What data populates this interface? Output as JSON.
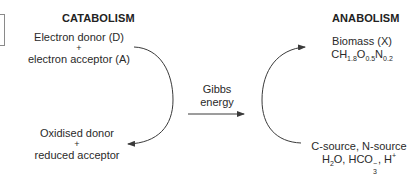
{
  "catabolism": {
    "heading": "CATABOLISM",
    "top_line1": "Electron donor (D)",
    "top_plus": "+",
    "top_line2": "electron acceptor (A)",
    "bottom_line1": "Oxidised donor",
    "bottom_plus": "+",
    "bottom_line2": "reduced acceptor"
  },
  "coupling": {
    "line1": "Gibbs",
    "line2": "energy"
  },
  "anabolism": {
    "heading": "ANABOLISM",
    "top_line1": "Biomass (X)",
    "formula": {
      "c": "CH",
      "h_sub": "1.8",
      "o": "O",
      "o_sub": "0.5",
      "n": "N",
      "n_sub": "0.2"
    },
    "bottom_line1": "C-source, N-source",
    "bottom_line2": {
      "h2o_a": "H",
      "h2o_sub": "2",
      "h2o_b": "O, HCO",
      "hco3_sub": "3",
      "hco3_sup": "−",
      "proton_sep": ", H",
      "proton_sup": "+"
    }
  },
  "colors": {
    "line": "#3a3a3a",
    "text": "#2a2a2a"
  }
}
